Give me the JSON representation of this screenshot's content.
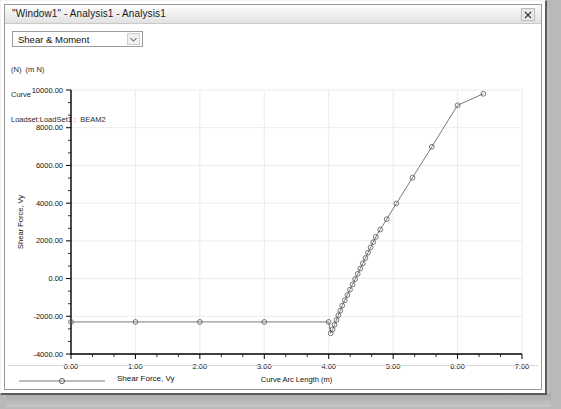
{
  "window": {
    "title": "\"Window1\" - Analysis1 - Analysis1",
    "close_label": "✖",
    "close_icon": "close-icon"
  },
  "toolbar": {
    "result_type": "Shear & Moment",
    "dropdown_icon": "chevron-down-icon"
  },
  "annotation": {
    "line1": "(N)  (m N)",
    "line2": "Curve",
    "line3": "Loadset:LoadSet1 :  BEAM2"
  },
  "legend": {
    "entries": [
      {
        "label": "Shear Force, Vy",
        "marker": "circle",
        "color": "#6b6b6b"
      }
    ]
  },
  "chart_data": {
    "type": "line",
    "title": "",
    "xlabel": "Curve Arc Length (m)",
    "ylabel": "Shear Force, Vy",
    "xlim": [
      0,
      7
    ],
    "ylim": [
      -4000,
      10000
    ],
    "xticks": [
      0,
      1,
      2,
      3,
      4,
      5,
      6,
      7
    ],
    "xtick_labels": [
      "0.00",
      "1.00",
      "2.00",
      "3.00",
      "4.00",
      "5.00",
      "6.00",
      "7.00"
    ],
    "yticks": [
      -4000,
      -2000,
      0,
      2000,
      4000,
      6000,
      8000,
      10000
    ],
    "ytick_labels": [
      "-4000.00",
      "-2000.00",
      "0.00",
      "2000.00",
      "4000.00",
      "6000.00",
      "8000.00",
      "10000.00"
    ],
    "xminor_per_major": 2,
    "yminor_per_major": 2,
    "grid": true,
    "legend_position": "bottom-left",
    "series": [
      {
        "name": "Shear Force, Vy",
        "color": "#6b6b6b",
        "marker": "circle",
        "x": [
          0.0,
          1.0,
          2.0,
          3.0,
          4.0,
          4.03,
          4.06,
          4.09,
          4.12,
          4.15,
          4.18,
          4.21,
          4.25,
          4.29,
          4.33,
          4.37,
          4.41,
          4.45,
          4.49,
          4.53,
          4.57,
          4.61,
          4.65,
          4.69,
          4.73,
          4.8,
          4.9,
          5.05,
          5.3,
          5.6,
          6.0,
          6.4
        ],
        "y": [
          -2300,
          -2300,
          -2300,
          -2300,
          -2300,
          -2900,
          -2700,
          -2450,
          -2200,
          -1950,
          -1700,
          -1430,
          -1150,
          -870,
          -590,
          -310,
          -30,
          250,
          530,
          810,
          1090,
          1370,
          1650,
          1930,
          2210,
          2600,
          3150,
          3980,
          5350,
          6990,
          9190,
          9800
        ]
      }
    ]
  }
}
